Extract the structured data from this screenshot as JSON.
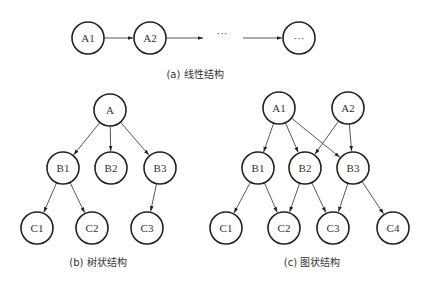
{
  "diagrams": {
    "linear": {
      "caption": "(a) 线性结构",
      "nodes": [
        {
          "id": "A1",
          "label": "A1",
          "x": 88,
          "y": 38
        },
        {
          "id": "A2",
          "label": "A2",
          "x": 150,
          "y": 38
        },
        {
          "id": "end",
          "label": "···",
          "x": 299,
          "y": 38
        }
      ],
      "ellipsis": "···",
      "edges": [
        [
          "A1",
          "A2"
        ],
        [
          "A2",
          "mid"
        ],
        [
          "mid",
          "end"
        ]
      ]
    },
    "tree": {
      "caption": "(b) 树状结构",
      "nodes": [
        {
          "id": "A",
          "label": "A",
          "x": 110,
          "y": 110
        },
        {
          "id": "B1",
          "label": "B1",
          "x": 63,
          "y": 168
        },
        {
          "id": "B2",
          "label": "B2",
          "x": 111,
          "y": 168
        },
        {
          "id": "B3",
          "label": "B3",
          "x": 160,
          "y": 168
        },
        {
          "id": "C1",
          "label": "C1",
          "x": 37,
          "y": 228
        },
        {
          "id": "C2",
          "label": "C2",
          "x": 92,
          "y": 228
        },
        {
          "id": "C3",
          "label": "C3",
          "x": 147,
          "y": 228
        }
      ],
      "edges": [
        [
          "A",
          "B1"
        ],
        [
          "A",
          "B2"
        ],
        [
          "A",
          "B3"
        ],
        [
          "B1",
          "C1"
        ],
        [
          "B1",
          "C2"
        ],
        [
          "B3",
          "C3"
        ]
      ]
    },
    "graph": {
      "caption": "(c) 图状结构",
      "nodes": [
        {
          "id": "A1",
          "label": "A1",
          "x": 279,
          "y": 108
        },
        {
          "id": "A2",
          "label": "A2",
          "x": 348,
          "y": 108
        },
        {
          "id": "B1",
          "label": "B1",
          "x": 258,
          "y": 168
        },
        {
          "id": "B2",
          "label": "B2",
          "x": 305,
          "y": 168
        },
        {
          "id": "B3",
          "label": "B3",
          "x": 353,
          "y": 168
        },
        {
          "id": "C1",
          "label": "C1",
          "x": 226,
          "y": 228
        },
        {
          "id": "C2",
          "label": "C2",
          "x": 284,
          "y": 228
        },
        {
          "id": "C3",
          "label": "C3",
          "x": 333,
          "y": 228
        },
        {
          "id": "C4",
          "label": "C4",
          "x": 393,
          "y": 228
        }
      ],
      "edges": [
        [
          "A1",
          "B1"
        ],
        [
          "A1",
          "B2"
        ],
        [
          "A1",
          "B3"
        ],
        [
          "A2",
          "B2"
        ],
        [
          "A2",
          "B3"
        ],
        [
          "B1",
          "C1"
        ],
        [
          "B1",
          "C2"
        ],
        [
          "B2",
          "C2"
        ],
        [
          "B2",
          "C3"
        ],
        [
          "B3",
          "C3"
        ],
        [
          "B3",
          "C4"
        ]
      ]
    }
  }
}
